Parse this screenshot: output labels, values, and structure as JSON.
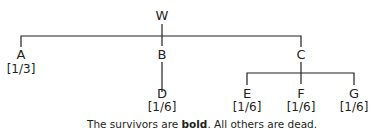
{
  "tree": {
    "root": {
      "label": "W"
    },
    "nodes": [
      {
        "id": "A",
        "label": "A",
        "share": "[1/3]"
      },
      {
        "id": "B",
        "label": "B",
        "share": ""
      },
      {
        "id": "C",
        "label": "C",
        "share": ""
      },
      {
        "id": "D",
        "label": "D",
        "share": "[1/6]"
      },
      {
        "id": "E",
        "label": "E",
        "share": "[1/6]"
      },
      {
        "id": "F",
        "label": "F",
        "share": "[1/6]"
      },
      {
        "id": "G",
        "label": "G",
        "share": "[1/6]"
      }
    ],
    "edges": [
      [
        "W",
        "A"
      ],
      [
        "W",
        "B"
      ],
      [
        "W",
        "C"
      ],
      [
        "B",
        "D"
      ],
      [
        "C",
        "E"
      ],
      [
        "C",
        "F"
      ],
      [
        "C",
        "G"
      ]
    ]
  },
  "caption": {
    "prefix": "The survivors are ",
    "bold": "bold",
    "suffix": ". All others are dead."
  },
  "colors": {
    "line": "#231f20",
    "text": "#231f20"
  }
}
